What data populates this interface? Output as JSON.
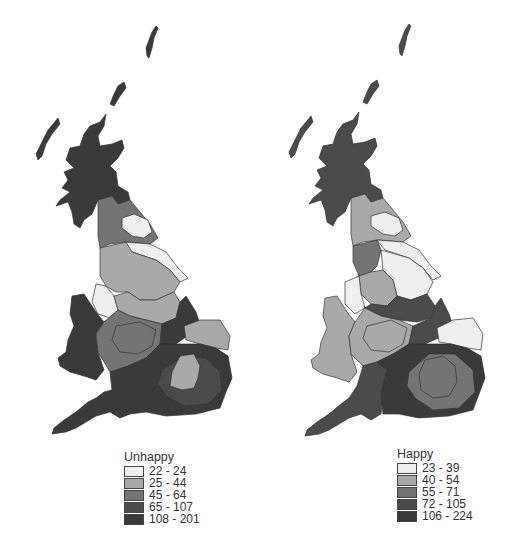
{
  "maps": [
    {
      "id": "unhappy",
      "legend": {
        "title": "Unhappy",
        "classes": [
          {
            "label": "22 - 24",
            "color": "#efefef"
          },
          {
            "label": "25 - 44",
            "color": "#a9a9a9"
          },
          {
            "label": "45 - 64",
            "color": "#747474"
          },
          {
            "label": "65 - 107",
            "color": "#4b4b4b"
          },
          {
            "label": "108 - 201",
            "color": "#3a3a3a"
          }
        ]
      }
    },
    {
      "id": "happy",
      "legend": {
        "title": "Happy",
        "classes": [
          {
            "label": "23 - 39",
            "color": "#efefef"
          },
          {
            "label": "40 - 54",
            "color": "#a9a9a9"
          },
          {
            "label": "55 - 71",
            "color": "#747474"
          },
          {
            "label": "72 - 105",
            "color": "#4b4b4b"
          },
          {
            "label": "106 - 224",
            "color": "#3a3a3a"
          }
        ]
      }
    }
  ]
}
